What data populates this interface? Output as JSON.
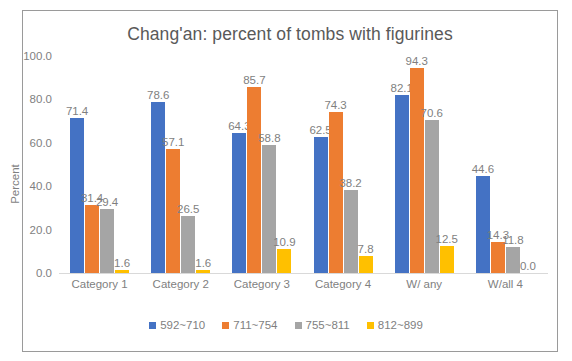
{
  "chart_data": {
    "type": "bar",
    "title": "Chang'an: percent of tombs with figurines",
    "xlabel": "",
    "ylabel": "Percent",
    "ylim": [
      0,
      100
    ],
    "yticks": [
      "100.0",
      "80.0",
      "60.0",
      "40.0",
      "20.0",
      "0.0"
    ],
    "ytick_values": [
      100,
      80,
      60,
      40,
      20,
      0
    ],
    "grid": false,
    "legend_position": "bottom",
    "categories": [
      "Category 1",
      "Category 2",
      "Category 3",
      "Category 4",
      "W/ any",
      "W/all 4"
    ],
    "series": [
      {
        "name": "592~710",
        "color": "#4472C4",
        "values": [
          71.4,
          78.6,
          64.3,
          62.5,
          82.1,
          44.6
        ],
        "labels": [
          "71.4",
          "78.6",
          "64.3",
          "62.5",
          "82.1",
          "44.6"
        ]
      },
      {
        "name": "711~754",
        "color": "#ED7D31",
        "values": [
          31.4,
          57.1,
          85.7,
          74.3,
          94.3,
          14.3
        ],
        "labels": [
          "31.4",
          "57.1",
          "85.7",
          "74.3",
          "94.3",
          "14.3"
        ]
      },
      {
        "name": "755~811",
        "color": "#A5A5A5",
        "values": [
          29.4,
          26.5,
          58.8,
          38.2,
          70.6,
          11.8
        ],
        "labels": [
          "29.4",
          "26.5",
          "58.8",
          "38.2",
          "70.6",
          "11.8"
        ]
      },
      {
        "name": "812~899",
        "color": "#FFC000",
        "values": [
          1.6,
          1.6,
          10.9,
          7.8,
          12.5,
          0.0
        ],
        "labels": [
          "1.6",
          "1.6",
          "10.9",
          "7.8",
          "12.5",
          "0.0"
        ]
      }
    ]
  },
  "colors": {
    "series_1": "#4472C4",
    "series_2": "#ED7D31",
    "series_3": "#A5A5A5",
    "series_4": "#FFC000",
    "text": "#7f7f7f",
    "title": "#595959",
    "frame_border": "#9a9a9a",
    "axis_line": "#d9d9d9"
  }
}
